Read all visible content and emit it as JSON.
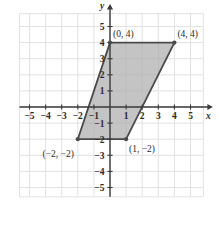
{
  "chart_data": {
    "type": "scatter",
    "title": "",
    "xlabel": "x",
    "ylabel": "y",
    "xlim": [
      -5.6,
      5.9
    ],
    "ylim": [
      -5.6,
      5.9
    ],
    "grid": true,
    "grid_step": 1,
    "legend": "none",
    "x_ticks": [
      {
        "value": -5,
        "label": "−5"
      },
      {
        "value": -4,
        "label": "−4"
      },
      {
        "value": -3,
        "label": "−3"
      },
      {
        "value": -2,
        "label": "−2"
      },
      {
        "value": -1,
        "label": "−1"
      },
      {
        "value": 1,
        "label": "1"
      },
      {
        "value": 2,
        "label": "2"
      },
      {
        "value": 3,
        "label": "3"
      },
      {
        "value": 4,
        "label": "4"
      },
      {
        "value": 5,
        "label": "5"
      }
    ],
    "y_ticks": [
      {
        "value": 5,
        "label": "5"
      },
      {
        "value": 4,
        "label": "4"
      },
      {
        "value": 3,
        "label": "3"
      },
      {
        "value": 2,
        "label": "2"
      },
      {
        "value": 1,
        "label": "1"
      },
      {
        "value": -1,
        "label": "−1"
      },
      {
        "value": -2,
        "label": "−2"
      },
      {
        "value": -3,
        "label": "−3"
      },
      {
        "value": -4,
        "label": "−4"
      },
      {
        "value": -5,
        "label": "−5"
      }
    ],
    "shapes": [
      {
        "name": "parallelogram",
        "kind": "polygon",
        "fill": "#adadad",
        "stroke": "#4a4a4a",
        "vertices": [
          {
            "x": 0,
            "y": 4,
            "label": "(0, 4)",
            "label_pos": "above-right"
          },
          {
            "x": 4,
            "y": 4,
            "label": "(4, 4)",
            "label_pos": "above-right"
          },
          {
            "x": 1,
            "y": -2,
            "label": "(1, −2)",
            "label_pos": "below-right"
          },
          {
            "x": -2,
            "y": -2,
            "label": "(−2, −2)",
            "label_pos": "below-left"
          }
        ]
      }
    ],
    "colors": {
      "fill": "#adadad",
      "outline": "#4a4a4a",
      "axis": "#3a3a3a",
      "grid": "#e2e2e2",
      "text": "#2b2b2b",
      "background": "#ffffff"
    }
  }
}
